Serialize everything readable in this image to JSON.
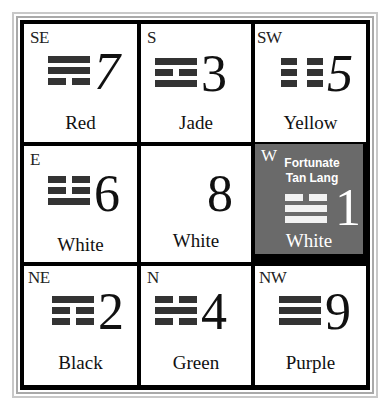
{
  "colors": {
    "frame_light": "#c8c8c8",
    "frame_dark": "#a9a9a9",
    "grid_line": "#000000",
    "cell_bg": "#ffffff",
    "highlight_bg": "#6a6a6a",
    "trigram": "#333333"
  },
  "cells": [
    {
      "direction": "SE",
      "number": "7",
      "color": "Red",
      "trigram": [
        "full",
        "full",
        "broken"
      ]
    },
    {
      "direction": "S",
      "number": "3",
      "color": "Jade",
      "trigram": [
        "full",
        "broken",
        "full"
      ]
    },
    {
      "direction": "SW",
      "number": "5",
      "color": "Yellow",
      "trigram": [
        "broken",
        "broken",
        "broken"
      ]
    },
    {
      "direction": "E",
      "number": "6",
      "color": "White",
      "trigram": [
        "broken",
        "broken",
        "full"
      ]
    },
    {
      "direction": "",
      "number": "8",
      "color": "White",
      "trigram": []
    },
    {
      "direction": "W",
      "number": "1",
      "color": "White",
      "trigram": [
        "broken",
        "full",
        "full"
      ],
      "highlight": true,
      "star_line1": "Fortunate",
      "star_line2": "Tan Lang"
    },
    {
      "direction": "NE",
      "number": "2",
      "color": "Black",
      "trigram": [
        "full",
        "broken",
        "broken"
      ]
    },
    {
      "direction": "N",
      "number": "4",
      "color": "Green",
      "trigram": [
        "broken",
        "full",
        "broken"
      ]
    },
    {
      "direction": "NW",
      "number": "9",
      "color": "Purple",
      "trigram": [
        "full",
        "full",
        "full"
      ]
    }
  ]
}
